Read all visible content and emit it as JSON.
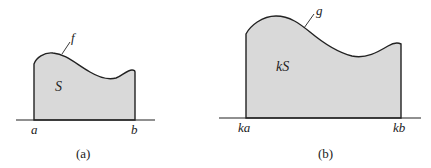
{
  "colors": {
    "fill": "#d9d9d9",
    "stroke": "#222222",
    "background": "#ffffff"
  },
  "panels": [
    {
      "id": "a",
      "caption": "(a)",
      "region_label": "S",
      "curve_label": "f",
      "left_tick": "a",
      "right_tick": "b"
    },
    {
      "id": "b",
      "caption": "(b)",
      "region_label": "kS",
      "curve_label": "g",
      "left_tick": "ka",
      "right_tick": "kb"
    }
  ]
}
